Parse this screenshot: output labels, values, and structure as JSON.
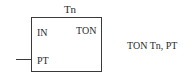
{
  "diagram": {
    "type": "ladder-function-block",
    "block": {
      "name": "Tn",
      "type_label": "TON",
      "inputs": [
        {
          "label": "IN",
          "wired": false
        },
        {
          "label": "PT",
          "wired": true
        }
      ]
    },
    "statement": "TON Tn, PT"
  }
}
